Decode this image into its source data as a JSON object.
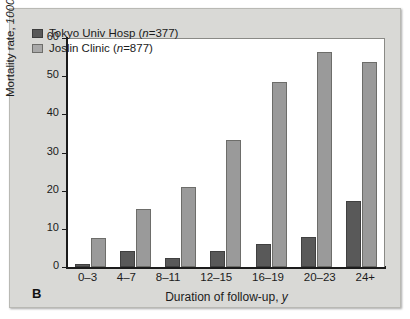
{
  "figure": {
    "panel_label": "B",
    "background_color": "#d9d9d6",
    "plot_background_color": "#ffffff"
  },
  "chart_data": {
    "type": "bar",
    "title": "",
    "xlabel_prefix": "Duration of follow-up, ",
    "xlabel_unit": "y",
    "ylabel_prefix": "Mortality rate, ",
    "ylabel_unit": "1000/y",
    "categories": [
      "0–3",
      "4–7",
      "8–11",
      "12–15",
      "16–19",
      "20–23",
      "24+"
    ],
    "series": [
      {
        "name": "Tokyo Univ Hosp",
        "n_prefix": "n",
        "n_value": "=377",
        "color": "#595959",
        "values": [
          0.7,
          4.2,
          2.4,
          4.3,
          6.1,
          7.8,
          17.2
        ]
      },
      {
        "name": "Joslin Clinic",
        "n_prefix": "n",
        "n_value": "=877",
        "color": "#9a9a9a",
        "values": [
          7.5,
          15.1,
          21.0,
          33.4,
          48.5,
          56.4,
          53.8
        ]
      }
    ],
    "ylim": [
      0,
      60
    ],
    "yticks": [
      0,
      10,
      20,
      30,
      40,
      50,
      60
    ],
    "ytick_labels": [
      "0",
      "10",
      "20",
      "30",
      "40",
      "50",
      "60"
    ],
    "grid": false,
    "legend_position": "top-left"
  }
}
